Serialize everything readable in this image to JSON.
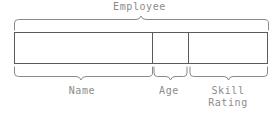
{
  "diagram": {
    "type": "record-field-layout",
    "group": {
      "label": "Employee",
      "brace_direction": "down",
      "span_px": [
        14,
        268
      ]
    },
    "record_box": {
      "x": 14,
      "y": 32,
      "width": 254,
      "height": 32,
      "border_color": "#5a5a5a",
      "fill_color": "#ffffff",
      "divider_positions_px": [
        152,
        188
      ]
    },
    "fields": [
      {
        "label": "Name",
        "label_lines": "Name",
        "span_px": [
          14,
          152
        ],
        "brace_direction": "up"
      },
      {
        "label": "Age",
        "label_lines": "Age",
        "span_px": [
          152,
          188
        ],
        "brace_direction": "up"
      },
      {
        "label": "Skill Rating",
        "label_lines": "Skill\nRating",
        "span_px": [
          188,
          268
        ],
        "brace_direction": "up"
      }
    ],
    "colors": {
      "text": "#8c8c8c",
      "brace": "#8a8a8a",
      "box_border": "#5a5a5a",
      "background": "#ffffff"
    }
  }
}
